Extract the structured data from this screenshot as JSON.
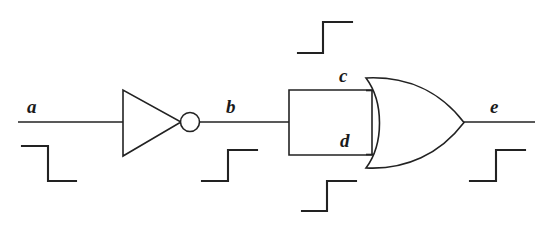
{
  "figure": {
    "type": "logic-circuit-timing-diagram",
    "background_color": "#ffffff",
    "line_color": "#222222",
    "width": 548,
    "height": 229
  },
  "labels": {
    "a": "a",
    "b": "b",
    "c": "c",
    "d": "d",
    "e": "e"
  },
  "gates": [
    {
      "id": "inverter",
      "type": "NOT",
      "inputs": [
        "a"
      ],
      "outputs": [
        "b"
      ]
    },
    {
      "id": "or-gate",
      "type": "OR",
      "inputs": [
        "c",
        "d"
      ],
      "outputs": [
        "e"
      ]
    }
  ],
  "nets": [
    {
      "name": "a",
      "role": "primary-input"
    },
    {
      "name": "b",
      "role": "inverter-output"
    },
    {
      "name": "c",
      "role": "or-input-top"
    },
    {
      "name": "d",
      "role": "or-input-bottom"
    },
    {
      "name": "e",
      "role": "primary-output"
    }
  ],
  "waveforms": [
    {
      "signal": "a",
      "transition": "falling",
      "levels": [
        "high",
        "low"
      ]
    },
    {
      "signal": "b",
      "transition": "rising",
      "levels": [
        "low",
        "high"
      ]
    },
    {
      "signal": "c",
      "transition": "rising",
      "levels": [
        "low",
        "high"
      ]
    },
    {
      "signal": "d",
      "transition": "rising",
      "levels": [
        "low",
        "high"
      ]
    },
    {
      "signal": "e",
      "transition": "rising",
      "levels": [
        "low",
        "high"
      ]
    }
  ]
}
